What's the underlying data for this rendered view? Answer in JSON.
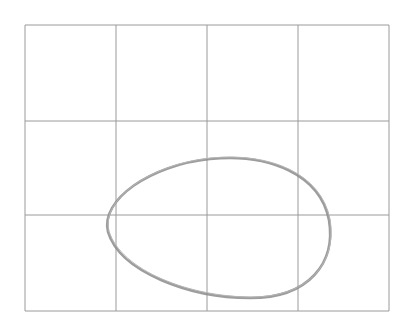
{
  "figure": {
    "grid": {
      "columns": 4,
      "rows": 3,
      "x_lines": [
        25,
        116,
        207,
        298,
        389
      ],
      "y_lines": [
        25,
        121,
        215,
        311
      ],
      "color": "#9a9a9a"
    },
    "curve": {
      "shape": "egg-oval",
      "color": "#8c8c8c",
      "path": "M 108 232 C 100 200, 150 165, 210 159 C 270 153, 320 175, 329 220 C 336 262, 310 298, 250 298 C 190 298, 120 272, 108 232 Z"
    }
  }
}
